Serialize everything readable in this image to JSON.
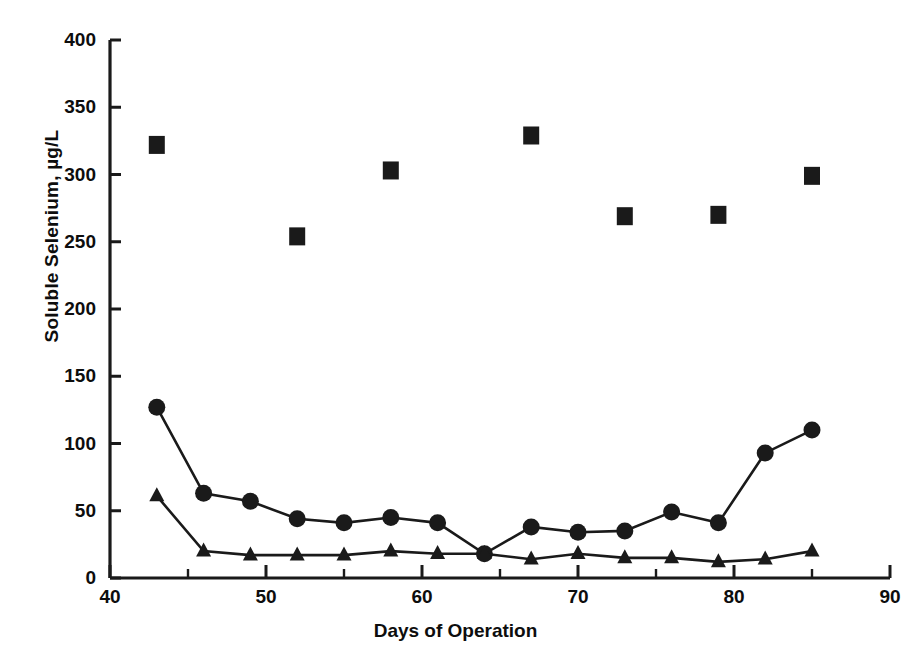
{
  "chart_data": {
    "type": "scatter",
    "title": "",
    "xlabel": "Days of Operation",
    "ylabel": "Soluble Selenium, µg/L",
    "xlim": [
      40,
      90
    ],
    "ylim": [
      0,
      400
    ],
    "xticks": [
      40,
      50,
      60,
      70,
      80,
      90
    ],
    "xticks_minor": [
      45,
      55,
      65,
      75,
      85
    ],
    "yticks": [
      0,
      50,
      100,
      150,
      200,
      250,
      300,
      350,
      400
    ],
    "grid": false,
    "legend": "none",
    "series": [
      {
        "name": "square-series",
        "marker": "square",
        "line": false,
        "color": "#1a1a1a",
        "x": [
          43,
          52,
          58,
          67,
          73,
          79,
          85
        ],
        "values": [
          322,
          254,
          303,
          329,
          269,
          270,
          299
        ]
      },
      {
        "name": "circle-series",
        "marker": "circle",
        "line": true,
        "color": "#1a1a1a",
        "x": [
          43,
          46,
          49,
          52,
          55,
          58,
          61,
          64,
          67,
          70,
          73,
          76,
          79,
          82,
          85
        ],
        "values": [
          127,
          63,
          57,
          44,
          41,
          45,
          41,
          18,
          38,
          34,
          35,
          49,
          41,
          93,
          110
        ]
      },
      {
        "name": "triangle-series",
        "marker": "triangle",
        "line": true,
        "color": "#1a1a1a",
        "x": [
          43,
          46,
          49,
          52,
          55,
          58,
          61,
          64,
          67,
          70,
          73,
          76,
          79,
          82,
          85
        ],
        "values": [
          61,
          20,
          17,
          17,
          17,
          20,
          18,
          18,
          14,
          18,
          15,
          15,
          12,
          14,
          20
        ]
      }
    ]
  },
  "axes": {
    "x_tick_labels": [
      "40",
      "50",
      "60",
      "70",
      "80",
      "90"
    ],
    "y_tick_labels": [
      "0",
      "50",
      "100",
      "150",
      "200",
      "250",
      "300",
      "350",
      "400"
    ],
    "x_axis_title": "Days of Operation",
    "y_axis_title": "Soluble Selenium, µg/L"
  },
  "style": {
    "axis_color": "#1a1a1a",
    "marker_color": "#1a1a1a",
    "background": "#ffffff"
  }
}
